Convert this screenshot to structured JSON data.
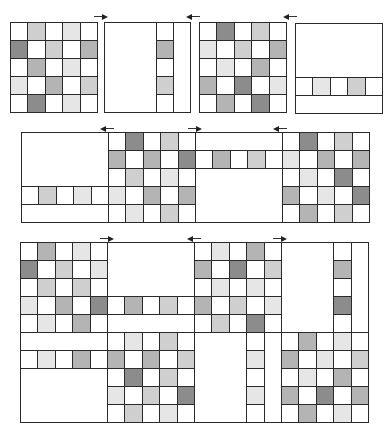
{
  "colors": {
    "w": "#ffffff",
    "l": "#e6e6e6",
    "m": "#cfcfcf",
    "d": "#b4b4b4",
    "x": "#8c8c8c",
    "border": "#2a2a2a"
  },
  "figure": {
    "rows": [
      {
        "name": "top-row",
        "panels": [
          {
            "name": "panel-a-full-grid",
            "x": 10,
            "y": 22,
            "w": 87,
            "h": 90,
            "type": "grid",
            "cells": [
              [
                "w",
                "m",
                "w",
                "l",
                "w"
              ],
              [
                "x",
                "w",
                "m",
                "w",
                "d"
              ],
              [
                "w",
                "d",
                "w",
                "l",
                "w"
              ],
              [
                "l",
                "w",
                "d",
                "w",
                "m"
              ],
              [
                "w",
                "x",
                "w",
                "l",
                "w"
              ]
            ]
          },
          {
            "name": "panel-b-vertical-strip",
            "x": 104,
            "y": 22,
            "w": 86,
            "h": 90,
            "type": "vstrip",
            "strip_col": 3,
            "cells": [
              "w",
              "d",
              "w",
              "m",
              "w"
            ]
          },
          {
            "name": "panel-c-full-grid",
            "x": 199,
            "y": 22,
            "w": 87,
            "h": 90,
            "type": "grid",
            "cells": [
              [
                "w",
                "x",
                "w",
                "m",
                "w"
              ],
              [
                "l",
                "w",
                "m",
                "w",
                "d"
              ],
              [
                "w",
                "l",
                "w",
                "d",
                "w"
              ],
              [
                "d",
                "w",
                "x",
                "w",
                "l"
              ],
              [
                "w",
                "d",
                "w",
                "x",
                "w"
              ]
            ]
          },
          {
            "name": "panel-d-horizontal-strip",
            "x": 295,
            "y": 23,
            "w": 87,
            "h": 90,
            "type": "hstrip",
            "strip_row": 3,
            "cells": [
              "w",
              "l",
              "w",
              "m",
              "w"
            ]
          }
        ],
        "arrows": [
          {
            "name": "shift-arrow-right-1",
            "x": 94,
            "y": 14,
            "w": 14,
            "dir": "right"
          },
          {
            "name": "shift-arrow-left-1",
            "x": 186,
            "y": 14,
            "w": 14,
            "dir": "left"
          },
          {
            "name": "shift-arrow-left-2",
            "x": 283,
            "y": 14,
            "w": 14,
            "dir": "left"
          },
          {
            "name": "shift-arrow-right-2",
            "x": 283,
            "y": 16,
            "w": 0,
            "dir": "none"
          }
        ]
      }
    ]
  },
  "middle": {
    "x": 21,
    "y": 132,
    "cw": 17.4,
    "ch": 18,
    "cols": 20,
    "rows": 5,
    "row_cells": [
      [
        "B",
        "B",
        "B",
        "B",
        "B",
        "w",
        "x",
        "w",
        "m",
        "w",
        "B",
        "B",
        "B",
        "B",
        "B",
        "w",
        "x",
        "w",
        "m",
        "w"
      ],
      [
        "B",
        "B",
        "B",
        "B",
        "B",
        "d",
        "w",
        "d",
        "w",
        "x",
        "w",
        "d",
        "w",
        "m",
        "w",
        "l",
        "w",
        "d",
        "w",
        "d"
      ],
      [
        "B",
        "B",
        "B",
        "B",
        "B",
        "w",
        "m",
        "w",
        "l",
        "w",
        "B",
        "B",
        "B",
        "B",
        "B",
        "w",
        "l",
        "w",
        "x",
        "w"
      ],
      [
        "w",
        "m",
        "w",
        "l",
        "w",
        "l",
        "w",
        "d",
        "w",
        "d",
        "B",
        "B",
        "B",
        "B",
        "B",
        "d",
        "w",
        "l",
        "w",
        "x"
      ],
      [
        "B",
        "B",
        "B",
        "B",
        "B",
        "w",
        "l",
        "w",
        "m",
        "w",
        "B",
        "B",
        "B",
        "B",
        "B",
        "w",
        "d",
        "w",
        "m",
        "w"
      ]
    ],
    "blanks": [
      {
        "name": "mid-blank-1-top",
        "c": 0,
        "r": 0,
        "cw": 5,
        "rh": 3
      },
      {
        "name": "mid-blank-1-bottom",
        "c": 0,
        "r": 4,
        "cw": 5,
        "rh": 1
      },
      {
        "name": "mid-blank-3-top",
        "c": 10,
        "r": 0,
        "cw": 5,
        "rh": 1
      },
      {
        "name": "mid-blank-3-bottom",
        "c": 10,
        "r": 2,
        "cw": 5,
        "rh": 3
      }
    ],
    "arrows": [
      {
        "name": "mid-shift-arrow-left-1",
        "x": 100,
        "y": 126,
        "w": 14,
        "dir": "left"
      },
      {
        "name": "mid-shift-arrow-right-1",
        "x": 188,
        "y": 126,
        "w": 14,
        "dir": "right"
      },
      {
        "name": "mid-shift-arrow-left-2",
        "x": 273,
        "y": 126,
        "w": 14,
        "dir": "left"
      }
    ]
  },
  "bottom": {
    "x": 20,
    "y": 242,
    "cw": 17.4,
    "ch": 18,
    "cols": 20,
    "rows": 10,
    "row_cells": [
      [
        "w",
        "d",
        "w",
        "l",
        "w",
        "B",
        "B",
        "B",
        "B",
        "B",
        "w",
        "l",
        "w",
        "d",
        "w",
        "B",
        "B",
        "B",
        "w",
        "B"
      ],
      [
        "x",
        "w",
        "m",
        "w",
        "l",
        "B",
        "B",
        "B",
        "B",
        "B",
        "d",
        "w",
        "x",
        "w",
        "m",
        "B",
        "B",
        "B",
        "d",
        "B"
      ],
      [
        "w",
        "m",
        "w",
        "m",
        "w",
        "B",
        "B",
        "B",
        "B",
        "B",
        "w",
        "l",
        "w",
        "l",
        "w",
        "B",
        "B",
        "B",
        "w",
        "B"
      ],
      [
        "l",
        "w",
        "d",
        "w",
        "x",
        "w",
        "d",
        "w",
        "m",
        "w",
        "d",
        "w",
        "m",
        "w",
        "l",
        "B",
        "B",
        "B",
        "x",
        "B"
      ],
      [
        "w",
        "l",
        "w",
        "d",
        "w",
        "B",
        "B",
        "B",
        "B",
        "B",
        "w",
        "m",
        "w",
        "x",
        "w",
        "B",
        "B",
        "B",
        "w",
        "B"
      ],
      [
        "B",
        "B",
        "B",
        "B",
        "B",
        "w",
        "l",
        "w",
        "m",
        "w",
        "B",
        "B",
        "B",
        "w",
        "B",
        "w",
        "d",
        "w",
        "l",
        "w"
      ],
      [
        "w",
        "l",
        "w",
        "d",
        "w",
        "d",
        "w",
        "d",
        "w",
        "m",
        "B",
        "B",
        "B",
        "l",
        "B",
        "d",
        "w",
        "l",
        "w",
        "m"
      ],
      [
        "B",
        "B",
        "B",
        "B",
        "B",
        "w",
        "x",
        "w",
        "m",
        "w",
        "B",
        "B",
        "B",
        "w",
        "B",
        "w",
        "l",
        "w",
        "d",
        "w"
      ],
      [
        "B",
        "B",
        "B",
        "B",
        "B",
        "l",
        "w",
        "m",
        "w",
        "x",
        "B",
        "B",
        "B",
        "l",
        "B",
        "d",
        "w",
        "x",
        "w",
        "d"
      ],
      [
        "B",
        "B",
        "B",
        "B",
        "B",
        "w",
        "m",
        "w",
        "l",
        "w",
        "B",
        "B",
        "B",
        "w",
        "B",
        "w",
        "d",
        "w",
        "l",
        "w"
      ]
    ],
    "blanks": [
      {
        "name": "bot-blank-2-top",
        "c": 5,
        "r": 0,
        "cw": 5,
        "rh": 3
      },
      {
        "name": "bot-blank-2-mid",
        "c": 5,
        "r": 4,
        "cw": 5,
        "rh": 1
      },
      {
        "name": "bot-blank-4-left",
        "c": 15,
        "r": 0,
        "cw": 3,
        "rh": 5
      },
      {
        "name": "bot-blank-4-right",
        "c": 19,
        "r": 0,
        "cw": 1,
        "rh": 5
      },
      {
        "name": "bot-blank-1-row5",
        "c": 0,
        "r": 5,
        "cw": 5,
        "rh": 1
      },
      {
        "name": "bot-blank-1-bottom",
        "c": 0,
        "r": 7,
        "cw": 5,
        "rh": 3
      },
      {
        "name": "bot-blank-3-left",
        "c": 10,
        "r": 5,
        "cw": 3,
        "rh": 5
      },
      {
        "name": "bot-blank-3-right",
        "c": 14,
        "r": 5,
        "cw": 1,
        "rh": 5
      }
    ],
    "arrows": [
      {
        "name": "bot-shift-arrow-right-1",
        "x": 100,
        "y": 236,
        "w": 14,
        "dir": "right"
      },
      {
        "name": "bot-shift-arrow-left-1",
        "x": 187,
        "y": 236,
        "w": 14,
        "dir": "left"
      },
      {
        "name": "bot-shift-arrow-right-2",
        "x": 273,
        "y": 236,
        "w": 14,
        "dir": "right"
      }
    ]
  }
}
